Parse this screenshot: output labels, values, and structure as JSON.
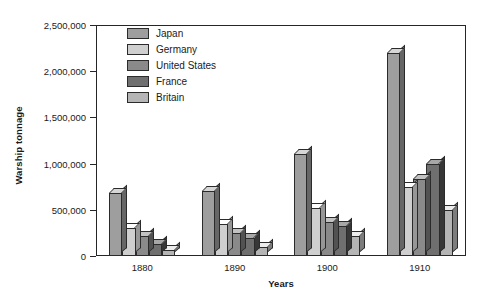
{
  "chart_data": {
    "type": "bar",
    "title": "",
    "xlabel": "Years",
    "ylabel": "Warship tonnage",
    "categories": [
      "1880",
      "1890",
      "1900",
      "1910"
    ],
    "ylim": [
      0,
      2500000
    ],
    "yticks": [
      0,
      500000,
      1000000,
      1500000,
      2000000,
      2500000
    ],
    "ytick_labels": [
      "0",
      "500,000",
      "1,000,000",
      "1,500,000",
      "2,000,000",
      "2,500,000"
    ],
    "grid": true,
    "grid_style": "dashed horizontal",
    "legend_position": "top-left inside plot",
    "series": [
      {
        "name": "Japan",
        "color": "#9e9e9e",
        "values": [
          680000,
          700000,
          1100000,
          2200000
        ]
      },
      {
        "name": "Germany",
        "color": "#cfcfcf",
        "values": [
          300000,
          350000,
          520000,
          750000
        ]
      },
      {
        "name": "United States",
        "color": "#8a8a8a",
        "values": [
          220000,
          250000,
          370000,
          830000
        ]
      },
      {
        "name": "France",
        "color": "#6f6f6f",
        "values": [
          130000,
          200000,
          330000,
          1000000
        ]
      },
      {
        "name": "Britain",
        "color": "#b5b5b5",
        "values": [
          60000,
          100000,
          220000,
          500000
        ]
      }
    ]
  }
}
